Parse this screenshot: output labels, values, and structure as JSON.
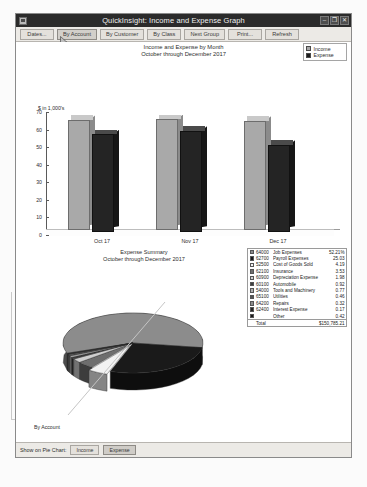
{
  "window": {
    "title": "QuickInsight: Income and Expense Graph",
    "icon": "app-icon",
    "minimize": "–",
    "maximize": "❐",
    "close": "✕"
  },
  "toolbar": {
    "buttons": [
      {
        "label": "Dates...",
        "active": false
      },
      {
        "label": "By Account",
        "active": true
      },
      {
        "label": "By Customer",
        "active": false
      },
      {
        "label": "By Class",
        "active": false
      },
      {
        "label": "Next Group",
        "active": false
      },
      {
        "label": "Print...",
        "active": false
      },
      {
        "label": "Refresh",
        "active": false
      }
    ]
  },
  "bar_chart_legend": [
    {
      "label": "Income",
      "color": "#a8a8a8"
    },
    {
      "label": "Expense",
      "color": "#1c1c1c"
    }
  ],
  "pie_legend_table": {
    "rows": [
      {
        "swatch": "#8c8c8c",
        "account": "64000",
        "name": "Job Expenses",
        "percent": "52.21%"
      },
      {
        "swatch": "#1a1a1a",
        "account": "62700",
        "name": "Payroll Expenses",
        "percent": "25.03"
      },
      {
        "swatch": "#f2f2f2",
        "account": "52500",
        "name": "Cost of Goods Sold",
        "percent": "4.19"
      },
      {
        "swatch": "#6e6e6e",
        "account": "62100",
        "name": "Insurance",
        "percent": "3.53"
      },
      {
        "swatch": "#cfcfcf",
        "account": "60900",
        "name": "Depreciation Expense",
        "percent": "1.98"
      },
      {
        "swatch": "#3d3d3d",
        "account": "60100",
        "name": "Automobile",
        "percent": "0.92"
      },
      {
        "swatch": "#b0b0b0",
        "account": "54000",
        "name": "Tools and Machinery",
        "percent": "0.77"
      },
      {
        "swatch": "#555555",
        "account": "65100",
        "name": "Utilities",
        "percent": "0.46"
      },
      {
        "swatch": "#8c8c8c",
        "account": "64200",
        "name": "Repairs",
        "percent": "0.32"
      },
      {
        "swatch": "#242424",
        "account": "62400",
        "name": "Interest Expense",
        "percent": "0.17"
      },
      {
        "swatch": "#1a1a1a",
        "account": "",
        "name": "Other",
        "percent": "0.42"
      }
    ],
    "total_label": "Total",
    "total_value": "$150,785.21"
  },
  "footer": {
    "by_account_label": "By Account",
    "show_label": "Show on Pie Chart:",
    "buttons": [
      {
        "label": "Income",
        "selected": false
      },
      {
        "label": "Expense",
        "selected": true
      }
    ]
  },
  "chart_data": [
    {
      "type": "bar",
      "title": "Income and Expense by Month",
      "subtitle": "October through December 2017",
      "xlabel": "",
      "ylabel": "$ in 1,000's",
      "categories": [
        "Oct 17",
        "Nov 17",
        "Dec 17"
      ],
      "yticks": [
        0,
        10,
        20,
        30,
        40,
        50,
        60,
        70
      ],
      "ylim": [
        0,
        70
      ],
      "grid": false,
      "legend_position": "top-right",
      "series": [
        {
          "name": "Income",
          "values": [
            62.5,
            63.0,
            62.0
          ],
          "color": "#a8a8a8"
        },
        {
          "name": "Expense",
          "values": [
            55.5,
            57.5,
            49.5
          ],
          "color": "#1c1c1c"
        }
      ]
    },
    {
      "type": "pie",
      "title": "Expense Summary",
      "subtitle": "October through December 2017",
      "legend_position": "right",
      "labels": [
        "Job Expenses",
        "Payroll Expenses",
        "Cost of Goods Sold",
        "Insurance",
        "Depreciation Expense",
        "Automobile",
        "Tools and Machinery",
        "Utilities",
        "Repairs",
        "Interest Expense",
        "Other"
      ],
      "values": [
        52.21,
        25.03,
        4.19,
        3.53,
        1.98,
        0.92,
        0.77,
        0.46,
        0.32,
        0.17,
        0.42
      ],
      "colors": [
        "#8c8c8c",
        "#1a1a1a",
        "#f2f2f2",
        "#6e6e6e",
        "#cfcfcf",
        "#3d3d3d",
        "#b0b0b0",
        "#555555",
        "#8c8c8c",
        "#242424",
        "#1a1a1a"
      ],
      "total": "$150,785.21"
    }
  ]
}
